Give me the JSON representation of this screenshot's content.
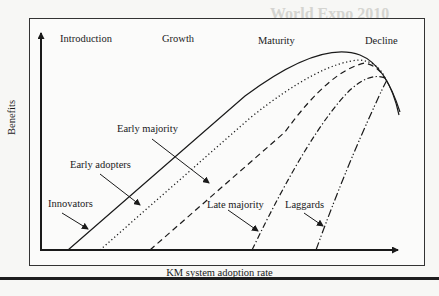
{
  "figure": {
    "stages": [
      "Introduction",
      "Growth",
      "Maturity",
      "Decline"
    ],
    "y_axis_label": "Benefits",
    "x_axis_label": "KM system adoption rate",
    "segments": [
      {
        "label": "Innovators",
        "line_style": "solid"
      },
      {
        "label": "Early adopters",
        "line_style": "dotted"
      },
      {
        "label": "Early majority",
        "line_style": "dashed"
      },
      {
        "label": "Late majority",
        "line_style": "dash-dot"
      },
      {
        "label": "Laggards",
        "line_style": "dash-dot-dot"
      }
    ]
  },
  "background": {
    "heading_fragment": "World Expo 2010"
  },
  "colors": {
    "line": "#1a1a1a",
    "background": "#f7f7f5",
    "faded_text": "#d9d9d6"
  }
}
